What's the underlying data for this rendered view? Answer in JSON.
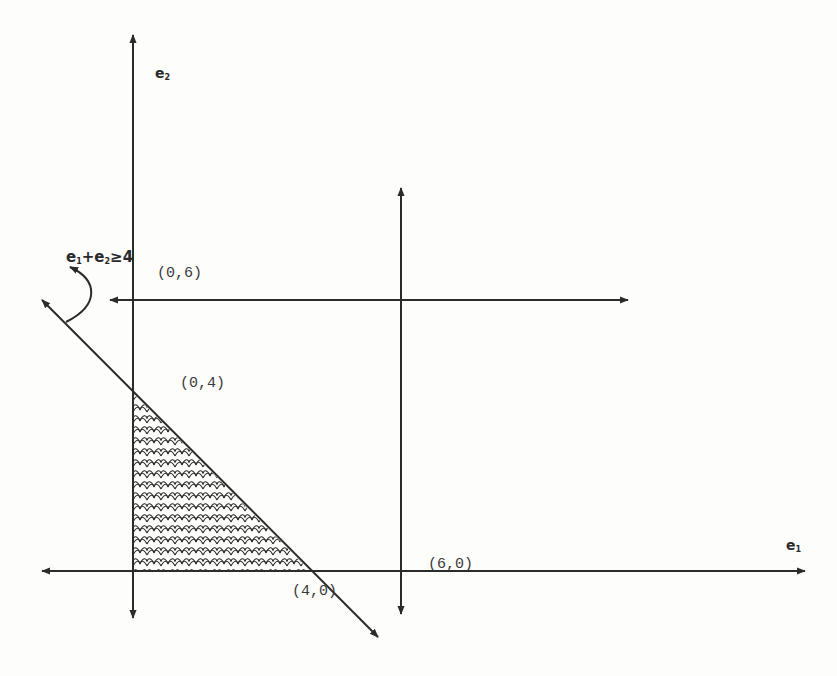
{
  "diagram": {
    "type": "feasible-region-plot",
    "axes": {
      "x_label": "e",
      "x_label_sub": "1",
      "y_label": "e",
      "y_label_sub": "2"
    },
    "constraint": {
      "label_e1": "e",
      "label_e1_sub": "1",
      "label_plus": "+",
      "label_e2": "e",
      "label_e2_sub": "2",
      "label_rel": "≥4",
      "full_text": "e1+e2≥4"
    },
    "points": [
      {
        "name": "point-0-6",
        "label": "(0,6)"
      },
      {
        "name": "point-0-4",
        "label": "(0,4)"
      },
      {
        "name": "point-4-0",
        "label": "(4,0)"
      },
      {
        "name": "point-6-0",
        "label": "(6,0)"
      }
    ],
    "lines": [
      {
        "name": "e2-axis",
        "equation": "e1 = 0"
      },
      {
        "name": "e1-axis",
        "equation": "e2 = 0"
      },
      {
        "name": "bound-e2-eq-6",
        "equation": "e2 = 6"
      },
      {
        "name": "bound-e1-eq-6",
        "equation": "e1 = 6"
      },
      {
        "name": "constraint-line",
        "equation": "e1 + e2 = 4"
      }
    ],
    "shaded_region": {
      "vertices": [
        [
          0,
          0
        ],
        [
          0,
          4
        ],
        [
          4,
          0
        ]
      ],
      "pattern": "scale-hatch"
    },
    "colors": {
      "ink": "#2b2b2b",
      "background": "#fdfdfc"
    }
  }
}
